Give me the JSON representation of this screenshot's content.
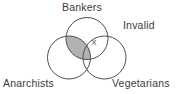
{
  "diagram": {
    "type": "venn-3-circle",
    "verdict_label": "Invalid",
    "x_mark": "X",
    "sets": [
      {
        "label": "Bankers",
        "position": "top"
      },
      {
        "label": "Anarchists",
        "position": "bottom-left"
      },
      {
        "label": "Vegetarians",
        "position": "bottom-right"
      }
    ],
    "shaded_region": "Bankers ∩ Anarchists (entire lens, including triple overlap)",
    "x_mark_region": "Bankers ∩ Vegetarians, outside Anarchists",
    "colors": {
      "background": "#ffffff",
      "circle_outline": "#4d4d4d",
      "shaded_fill": "#b3b2b2",
      "text": "#3b3b3b"
    }
  }
}
